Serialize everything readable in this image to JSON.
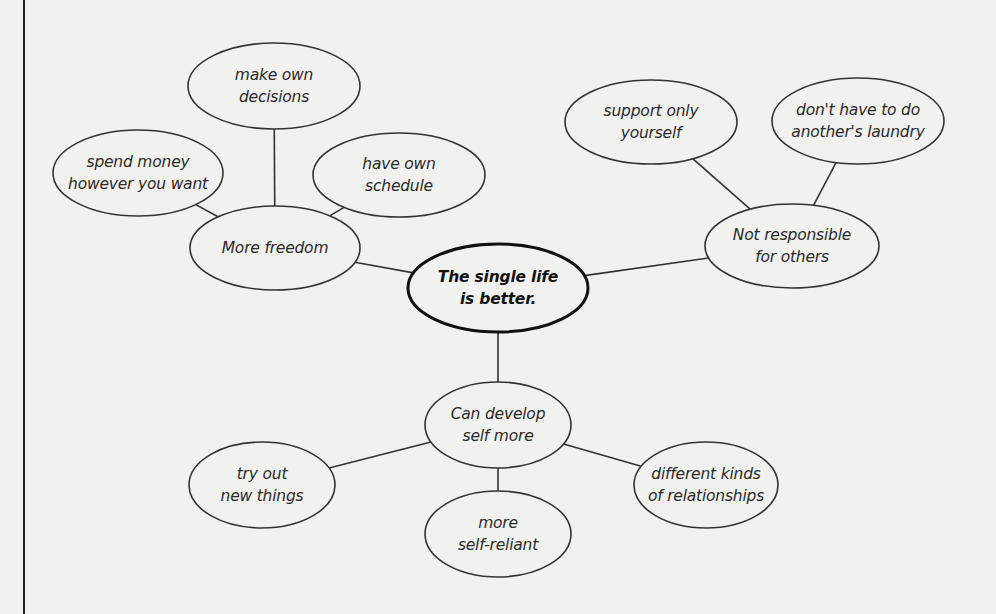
{
  "diagram": {
    "type": "cluster-map",
    "background": "#f1f1ef",
    "stroke_color": "#333333",
    "root": {
      "id": "root",
      "lines": [
        "The single life",
        "is better."
      ],
      "cx": 498,
      "cy": 288,
      "rx": 90,
      "ry": 44,
      "bold": true
    },
    "branches": [
      {
        "id": "more-freedom",
        "lines": [
          "More freedom"
        ],
        "cx": 275,
        "cy": 248,
        "rx": 85,
        "ry": 42,
        "children": [
          {
            "id": "make-own-decisions",
            "lines": [
              "make own",
              "decisions"
            ],
            "cx": 274,
            "cy": 86,
            "rx": 86,
            "ry": 43
          },
          {
            "id": "spend-money",
            "lines": [
              "spend money",
              "however you want"
            ],
            "cx": 138,
            "cy": 173,
            "rx": 85,
            "ry": 43
          },
          {
            "id": "have-own-schedule",
            "lines": [
              "have own",
              "schedule"
            ],
            "cx": 399,
            "cy": 175,
            "rx": 86,
            "ry": 42
          }
        ]
      },
      {
        "id": "not-responsible",
        "lines": [
          "Not responsible",
          "for others"
        ],
        "cx": 792,
        "cy": 246,
        "rx": 87,
        "ry": 42,
        "children": [
          {
            "id": "support-only-yourself",
            "lines": [
              "support only",
              "yourself"
            ],
            "cx": 651,
            "cy": 122,
            "rx": 86,
            "ry": 42
          },
          {
            "id": "dont-have-to-do-laundry",
            "lines": [
              "don't have to do",
              "another's laundry"
            ],
            "cx": 858,
            "cy": 121,
            "rx": 86,
            "ry": 43
          }
        ]
      },
      {
        "id": "can-develop-self",
        "lines": [
          "Can develop",
          "self more"
        ],
        "cx": 498,
        "cy": 425,
        "rx": 73,
        "ry": 43,
        "children": [
          {
            "id": "try-out-new-things",
            "lines": [
              "try out",
              "new things"
            ],
            "cx": 262,
            "cy": 485,
            "rx": 73,
            "ry": 43
          },
          {
            "id": "more-self-reliant",
            "lines": [
              "more",
              "self-reliant"
            ],
            "cx": 498,
            "cy": 534,
            "rx": 73,
            "ry": 43
          },
          {
            "id": "different-kinds-of-relationships",
            "lines": [
              "different kinds",
              "of relationships"
            ],
            "cx": 706,
            "cy": 485,
            "rx": 72,
            "ry": 43
          }
        ]
      }
    ]
  }
}
